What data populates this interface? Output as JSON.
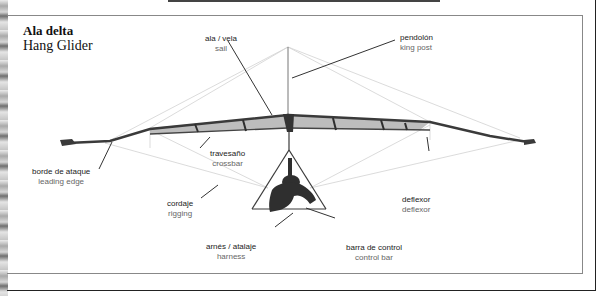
{
  "title": {
    "spanish": "Ala delta",
    "english": "Hang Glider"
  },
  "labels": [
    {
      "id": "sail",
      "spanish": "ala / vela",
      "english": "sail"
    },
    {
      "id": "king-post",
      "spanish": "pendolón",
      "english": "king post"
    },
    {
      "id": "crossbar",
      "spanish": "travesaño",
      "english": "crossbar"
    },
    {
      "id": "leading-edge",
      "spanish": "borde de ataque",
      "english": "leading edge"
    },
    {
      "id": "rigging",
      "spanish": "cordaje",
      "english": "rigging"
    },
    {
      "id": "deflexor",
      "spanish": "deflexor",
      "english": "deflexor"
    },
    {
      "id": "harness",
      "spanish": "arnés / atalaje",
      "english": "harness"
    },
    {
      "id": "control-bar",
      "spanish": "barra de control",
      "english": "control bar"
    }
  ],
  "colors": {
    "frame": "#222222",
    "panel_border": "#888888",
    "sail_fill": "#b9b9b9",
    "tube": "#3a3a3a",
    "leader_line": "#333333",
    "rigging_wire": "#cfcfcf"
  }
}
